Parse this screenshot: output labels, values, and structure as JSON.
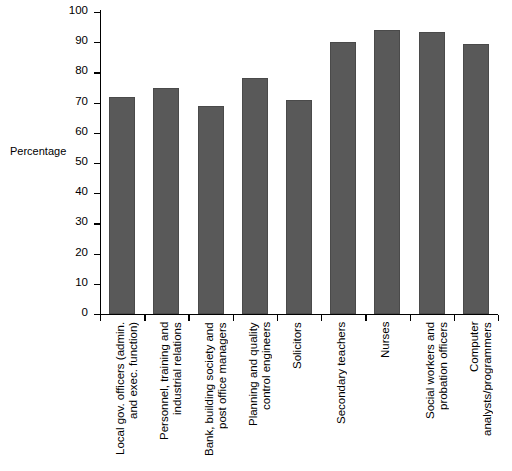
{
  "chart_data": {
    "type": "bar",
    "title": "",
    "subtitle": "",
    "xlabel": "",
    "ylabel": "Percentage",
    "ylim": [
      0,
      100
    ],
    "ytick_step": 10,
    "grid": false,
    "legend": null,
    "bar_color": "#595959",
    "axis_color": "#000000",
    "categories": [
      "Local gov. officers (admin.\nand exec. function)",
      "Personnel, training and\nindustrial relations",
      "Bank, building society and\npost office managers",
      "Planning and quality\ncontrol engineers",
      "Solicitors",
      "Secondary teachers",
      "Nurses",
      "Social workers and\nprobation officers",
      "Computer\nanalysts/programmers"
    ],
    "values": [
      72,
      75,
      69,
      78,
      71,
      90,
      94,
      93.5,
      89.5
    ],
    "yticks": [
      "0",
      "10",
      "20",
      "30",
      "40",
      "50",
      "60",
      "70",
      "80",
      "90",
      "100"
    ]
  }
}
